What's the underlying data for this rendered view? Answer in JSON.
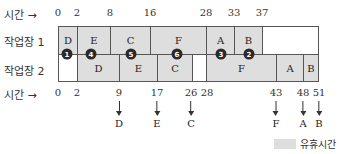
{
  "axis_top": {
    "label": "시간",
    "arrow": "→",
    "ticks": [
      "0",
      "2",
      "8",
      "16",
      "28",
      "33",
      "37"
    ]
  },
  "axis_bottom": {
    "label": "시간",
    "arrow": "→",
    "ticks": [
      "0",
      "2",
      "9",
      "17",
      "26",
      "28",
      "43",
      "48",
      "51"
    ],
    "completions": [
      {
        "time": "9",
        "job": "D"
      },
      {
        "time": "17",
        "job": "E"
      },
      {
        "time": "26",
        "job": "C"
      },
      {
        "time": "43",
        "job": "F"
      },
      {
        "time": "48",
        "job": "A"
      },
      {
        "time": "51",
        "job": "B"
      }
    ]
  },
  "rows": [
    {
      "label": "작업장 1",
      "blocks": [
        {
          "job": "D",
          "start": 0,
          "end": 2,
          "idle": false
        },
        {
          "job": "E",
          "start": 2,
          "end": 8,
          "idle": false
        },
        {
          "job": "C",
          "start": 8,
          "end": 16,
          "idle": false
        },
        {
          "job": "F",
          "start": 16,
          "end": 28,
          "idle": false
        },
        {
          "job": "A",
          "start": 28,
          "end": 33,
          "idle": false
        },
        {
          "job": "B",
          "start": 33,
          "end": 37,
          "idle": false
        },
        {
          "job": "",
          "start": 37,
          "end": 51,
          "idle": true
        }
      ]
    },
    {
      "label": "작업장 2",
      "blocks": [
        {
          "job": "",
          "start": 0,
          "end": 2,
          "idle": true
        },
        {
          "job": "D",
          "start": 2,
          "end": 9,
          "idle": false
        },
        {
          "job": "E",
          "start": 9,
          "end": 17,
          "idle": false
        },
        {
          "job": "C",
          "start": 17,
          "end": 26,
          "idle": false
        },
        {
          "job": "",
          "start": 26,
          "end": 28,
          "idle": true
        },
        {
          "job": "F",
          "start": 28,
          "end": 43,
          "idle": false
        },
        {
          "job": "A",
          "start": 43,
          "end": 48,
          "idle": false
        },
        {
          "job": "B",
          "start": 48,
          "end": 51,
          "idle": false
        }
      ]
    }
  ],
  "markers": [
    {
      "num": "1",
      "x": 67
    },
    {
      "num": "4",
      "x": 91
    },
    {
      "num": "5",
      "x": 131
    },
    {
      "num": "6",
      "x": 177
    },
    {
      "num": "3",
      "x": 221
    },
    {
      "num": "2",
      "x": 249
    }
  ],
  "legend": {
    "label": "유휴시간",
    "color": "#dedede"
  }
}
